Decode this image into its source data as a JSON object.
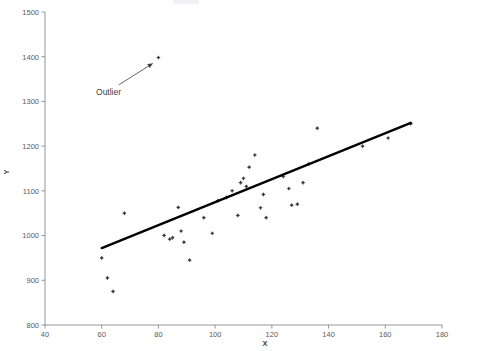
{
  "chart_data": {
    "type": "scatter",
    "title": "",
    "xlabel": "X",
    "ylabel": "Y",
    "xlim": [
      40,
      180
    ],
    "ylim": [
      800,
      1500
    ],
    "xticks": [
      40,
      60,
      80,
      100,
      120,
      140,
      160,
      180
    ],
    "yticks": [
      800,
      900,
      1000,
      1100,
      1200,
      1300,
      1400,
      1500
    ],
    "grid": false,
    "legend": null,
    "marker_color": "#3c3c3e",
    "line_color": "#000000",
    "axis_color": "#8a8a8c",
    "points": [
      {
        "x": 60,
        "y": 950
      },
      {
        "x": 62,
        "y": 905
      },
      {
        "x": 64,
        "y": 875
      },
      {
        "x": 68,
        "y": 1050
      },
      {
        "x": 80,
        "y": 1398
      },
      {
        "x": 82,
        "y": 1000
      },
      {
        "x": 84,
        "y": 992
      },
      {
        "x": 85,
        "y": 995
      },
      {
        "x": 87,
        "y": 1063
      },
      {
        "x": 88,
        "y": 1010
      },
      {
        "x": 89,
        "y": 985
      },
      {
        "x": 91,
        "y": 945
      },
      {
        "x": 96,
        "y": 1040
      },
      {
        "x": 99,
        "y": 1005
      },
      {
        "x": 101,
        "y": 1078
      },
      {
        "x": 104,
        "y": 1085
      },
      {
        "x": 106,
        "y": 1100
      },
      {
        "x": 108,
        "y": 1045
      },
      {
        "x": 109,
        "y": 1118
      },
      {
        "x": 110,
        "y": 1128
      },
      {
        "x": 111,
        "y": 1110
      },
      {
        "x": 112,
        "y": 1153
      },
      {
        "x": 114,
        "y": 1180
      },
      {
        "x": 116,
        "y": 1062
      },
      {
        "x": 117,
        "y": 1092
      },
      {
        "x": 118,
        "y": 1040
      },
      {
        "x": 124,
        "y": 1132
      },
      {
        "x": 126,
        "y": 1105
      },
      {
        "x": 127,
        "y": 1068
      },
      {
        "x": 129,
        "y": 1070
      },
      {
        "x": 131,
        "y": 1118
      },
      {
        "x": 133,
        "y": 1160
      },
      {
        "x": 136,
        "y": 1240
      },
      {
        "x": 152,
        "y": 1200
      },
      {
        "x": 161,
        "y": 1218
      },
      {
        "x": 169,
        "y": 1250
      }
    ],
    "trend_line": {
      "x0": 60,
      "y0": 972,
      "x1": 169,
      "y1": 1252
    },
    "annotations": [
      {
        "text": "Outlier",
        "label_x": 58,
        "label_y": 1322,
        "arrow_from_x": 66,
        "arrow_from_y": 1337,
        "arrow_to_x": 78,
        "arrow_to_y": 1385
      }
    ]
  }
}
